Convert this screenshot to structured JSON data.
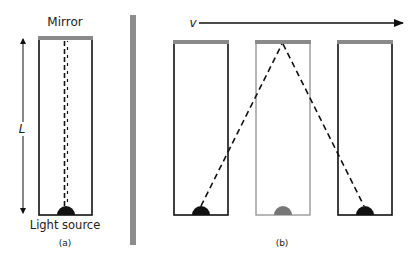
{
  "panel_a": {
    "mirror_label": "Mirror",
    "length_label": "L",
    "source_label": "Light source",
    "caption": "(a)"
  },
  "panel_b": {
    "velocity_label": "v",
    "caption": "(b)"
  },
  "colors": {
    "mirror": "#8a8a8a",
    "box_stroke": "#111111",
    "faded_box_stroke": "#999999",
    "source": "#111111",
    "faded_source": "#777777",
    "divider": "#8c8c8c"
  }
}
